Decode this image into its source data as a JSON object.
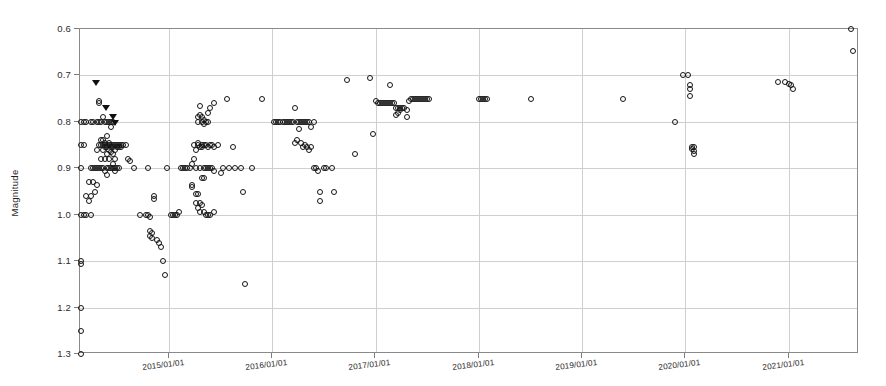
{
  "chart_data": {
    "type": "scatter",
    "title": "",
    "xlabel": "",
    "ylabel": "Magnitude",
    "grid": true,
    "legend": false,
    "y_inverted": true,
    "ylim": [
      0.6,
      1.3
    ],
    "yticks": [
      "0.6",
      "0.7",
      "0.8",
      "0.9",
      "1.0",
      "1.1",
      "1.2",
      "1.3"
    ],
    "ytick_values": [
      0.6,
      0.7,
      0.8,
      0.9,
      1.0,
      1.1,
      1.2,
      1.3
    ],
    "xticks": [
      "2015/01/01",
      "2016/01/01",
      "2017/01/01",
      "2018/01/01",
      "2019/01/01",
      "2020/01/01",
      "2021/01/01"
    ],
    "xtick_values": [
      2015.0,
      2016.0,
      2017.0,
      2018.0,
      2019.0,
      2020.0,
      2021.0
    ],
    "xlim": [
      2014.14,
      2021.68
    ],
    "marker_color": "#141414",
    "marker_style": "open-circle",
    "limit_marker_style": "filled-down-triangle",
    "series": [
      {
        "name": "observations",
        "marker": "open-circle",
        "points": [
          [
            2014.15,
            0.8
          ],
          [
            2014.15,
            0.85
          ],
          [
            2014.15,
            0.9
          ],
          [
            2014.15,
            1.0
          ],
          [
            2014.15,
            1.1
          ],
          [
            2014.15,
            1.105
          ],
          [
            2014.15,
            1.2
          ],
          [
            2014.15,
            1.25
          ],
          [
            2014.15,
            1.3
          ],
          [
            2014.18,
            0.8
          ],
          [
            2014.18,
            0.85
          ],
          [
            2014.18,
            1.0
          ],
          [
            2014.2,
            0.8
          ],
          [
            2014.2,
            0.96
          ],
          [
            2014.2,
            1.0
          ],
          [
            2014.23,
            0.93
          ],
          [
            2014.23,
            0.97
          ],
          [
            2014.25,
            0.8
          ],
          [
            2014.25,
            0.9
          ],
          [
            2014.25,
            0.96
          ],
          [
            2014.25,
            1.0
          ],
          [
            2014.27,
            0.8
          ],
          [
            2014.27,
            0.9
          ],
          [
            2014.27,
            0.93
          ],
          [
            2014.28,
            0.9
          ],
          [
            2014.28,
            0.95
          ],
          [
            2014.3,
            0.8
          ],
          [
            2014.3,
            0.86
          ],
          [
            2014.3,
            0.9
          ],
          [
            2014.3,
            0.935
          ],
          [
            2014.32,
            0.755
          ],
          [
            2014.32,
            0.76
          ],
          [
            2014.32,
            0.8
          ],
          [
            2014.32,
            0.85
          ],
          [
            2014.32,
            0.9
          ],
          [
            2014.34,
            0.8
          ],
          [
            2014.34,
            0.84
          ],
          [
            2014.34,
            0.85
          ],
          [
            2014.34,
            0.88
          ],
          [
            2014.34,
            0.9
          ],
          [
            2014.36,
            0.79
          ],
          [
            2014.36,
            0.84
          ],
          [
            2014.36,
            0.85
          ],
          [
            2014.36,
            0.86
          ],
          [
            2014.36,
            0.9
          ],
          [
            2014.38,
            0.8
          ],
          [
            2014.38,
            0.845
          ],
          [
            2014.38,
            0.85
          ],
          [
            2014.38,
            0.855
          ],
          [
            2014.38,
            0.88
          ],
          [
            2014.38,
            0.905
          ],
          [
            2014.4,
            0.8
          ],
          [
            2014.4,
            0.83
          ],
          [
            2014.4,
            0.85
          ],
          [
            2014.4,
            0.855
          ],
          [
            2014.4,
            0.87
          ],
          [
            2014.4,
            0.9
          ],
          [
            2014.4,
            0.915
          ],
          [
            2014.42,
            0.8
          ],
          [
            2014.42,
            0.845
          ],
          [
            2014.42,
            0.85
          ],
          [
            2014.42,
            0.86
          ],
          [
            2014.42,
            0.88
          ],
          [
            2014.42,
            0.9
          ],
          [
            2014.44,
            0.8
          ],
          [
            2014.44,
            0.81
          ],
          [
            2014.44,
            0.85
          ],
          [
            2014.44,
            0.855
          ],
          [
            2014.44,
            0.865
          ],
          [
            2014.44,
            0.9
          ],
          [
            2014.46,
            0.8
          ],
          [
            2014.46,
            0.85
          ],
          [
            2014.46,
            0.855
          ],
          [
            2014.46,
            0.87
          ],
          [
            2014.46,
            0.89
          ],
          [
            2014.46,
            0.9
          ],
          [
            2014.48,
            0.85
          ],
          [
            2014.48,
            0.86
          ],
          [
            2014.48,
            0.88
          ],
          [
            2014.48,
            0.9
          ],
          [
            2014.48,
            0.905
          ],
          [
            2014.5,
            0.85
          ],
          [
            2014.5,
            0.855
          ],
          [
            2014.5,
            0.9
          ],
          [
            2014.52,
            0.85
          ],
          [
            2014.52,
            0.855
          ],
          [
            2014.52,
            0.9
          ],
          [
            2014.54,
            0.85
          ],
          [
            2014.54,
            0.855
          ],
          [
            2014.56,
            0.85
          ],
          [
            2014.58,
            0.85
          ],
          [
            2014.6,
            0.88
          ],
          [
            2014.62,
            0.885
          ],
          [
            2014.66,
            0.9
          ],
          [
            2014.72,
            1.0
          ],
          [
            2014.78,
            1.0
          ],
          [
            2014.8,
            0.9
          ],
          [
            2014.8,
            1.0
          ],
          [
            2014.82,
            1.005
          ],
          [
            2014.82,
            1.035
          ],
          [
            2014.82,
            1.045
          ],
          [
            2014.84,
            1.04
          ],
          [
            2014.84,
            1.05
          ],
          [
            2014.86,
            0.96
          ],
          [
            2014.86,
            0.965
          ],
          [
            2014.88,
            1.055
          ],
          [
            2014.9,
            1.06
          ],
          [
            2014.92,
            1.07
          ],
          [
            2014.94,
            1.1
          ],
          [
            2014.96,
            1.13
          ],
          [
            2014.98,
            0.9
          ],
          [
            2015.02,
            1.0
          ],
          [
            2015.04,
            1.0
          ],
          [
            2015.06,
            1.0
          ],
          [
            2015.08,
            1.0
          ],
          [
            2015.1,
            0.995
          ],
          [
            2015.12,
            0.9
          ],
          [
            2015.14,
            0.9
          ],
          [
            2015.16,
            0.9
          ],
          [
            2015.18,
            0.9
          ],
          [
            2015.2,
            0.9
          ],
          [
            2015.22,
            0.89
          ],
          [
            2015.22,
            0.935
          ],
          [
            2015.22,
            0.94
          ],
          [
            2015.24,
            0.85
          ],
          [
            2015.24,
            0.88
          ],
          [
            2015.26,
            0.86
          ],
          [
            2015.26,
            0.9
          ],
          [
            2015.26,
            0.955
          ],
          [
            2015.26,
            0.975
          ],
          [
            2015.28,
            0.79
          ],
          [
            2015.28,
            0.8
          ],
          [
            2015.28,
            0.845
          ],
          [
            2015.28,
            0.85
          ],
          [
            2015.28,
            0.955
          ],
          [
            2015.28,
            0.985
          ],
          [
            2015.3,
            0.765
          ],
          [
            2015.3,
            0.785
          ],
          [
            2015.3,
            0.855
          ],
          [
            2015.3,
            0.9
          ],
          [
            2015.3,
            0.975
          ],
          [
            2015.3,
            0.995
          ],
          [
            2015.32,
            0.79
          ],
          [
            2015.32,
            0.8
          ],
          [
            2015.32,
            0.85
          ],
          [
            2015.32,
            0.855
          ],
          [
            2015.32,
            0.92
          ],
          [
            2015.32,
            0.98
          ],
          [
            2015.34,
            0.795
          ],
          [
            2015.34,
            0.805
          ],
          [
            2015.34,
            0.85
          ],
          [
            2015.34,
            0.9
          ],
          [
            2015.34,
            0.92
          ],
          [
            2015.34,
            0.995
          ],
          [
            2015.36,
            0.8
          ],
          [
            2015.36,
            0.85
          ],
          [
            2015.36,
            0.9
          ],
          [
            2015.36,
            1.0
          ],
          [
            2015.38,
            0.78
          ],
          [
            2015.38,
            0.8
          ],
          [
            2015.38,
            0.855
          ],
          [
            2015.38,
            0.9
          ],
          [
            2015.38,
            1.0
          ],
          [
            2015.4,
            0.77
          ],
          [
            2015.4,
            0.85
          ],
          [
            2015.4,
            0.9
          ],
          [
            2015.4,
            1.0
          ],
          [
            2015.42,
            0.85
          ],
          [
            2015.42,
            0.9
          ],
          [
            2015.44,
            0.76
          ],
          [
            2015.44,
            0.855
          ],
          [
            2015.44,
            0.905
          ],
          [
            2015.44,
            0.995
          ],
          [
            2015.48,
            0.85
          ],
          [
            2015.5,
            0.91
          ],
          [
            2015.52,
            0.9
          ],
          [
            2015.56,
            0.75
          ],
          [
            2015.58,
            0.9
          ],
          [
            2015.62,
            0.855
          ],
          [
            2015.64,
            0.9
          ],
          [
            2015.7,
            0.9
          ],
          [
            2015.72,
            0.95
          ],
          [
            2015.74,
            1.15
          ],
          [
            2015.8,
            0.9
          ],
          [
            2015.9,
            0.75
          ],
          [
            2016.02,
            0.8
          ],
          [
            2016.04,
            0.8
          ],
          [
            2016.06,
            0.8
          ],
          [
            2016.08,
            0.8
          ],
          [
            2016.1,
            0.8
          ],
          [
            2016.12,
            0.8
          ],
          [
            2016.14,
            0.8
          ],
          [
            2016.16,
            0.8
          ],
          [
            2016.18,
            0.8
          ],
          [
            2016.2,
            0.8
          ],
          [
            2016.22,
            0.77
          ],
          [
            2016.22,
            0.845
          ],
          [
            2016.24,
            0.8
          ],
          [
            2016.24,
            0.84
          ],
          [
            2016.26,
            0.8
          ],
          [
            2016.26,
            0.815
          ],
          [
            2016.28,
            0.8
          ],
          [
            2016.28,
            0.845
          ],
          [
            2016.3,
            0.8
          ],
          [
            2016.3,
            0.855
          ],
          [
            2016.32,
            0.8
          ],
          [
            2016.32,
            0.85
          ],
          [
            2016.34,
            0.8
          ],
          [
            2016.34,
            0.855
          ],
          [
            2016.36,
            0.8
          ],
          [
            2016.36,
            0.86
          ],
          [
            2016.38,
            0.81
          ],
          [
            2016.38,
            0.855
          ],
          [
            2016.4,
            0.8
          ],
          [
            2016.4,
            0.9
          ],
          [
            2016.42,
            0.9
          ],
          [
            2016.44,
            0.905
          ],
          [
            2016.46,
            0.95
          ],
          [
            2016.46,
            0.97
          ],
          [
            2016.5,
            0.9
          ],
          [
            2016.52,
            0.9
          ],
          [
            2016.58,
            0.9
          ],
          [
            2016.6,
            0.95
          ],
          [
            2016.72,
            0.71
          ],
          [
            2016.8,
            0.87
          ],
          [
            2017.0,
            0.755
          ],
          [
            2017.02,
            0.76
          ],
          [
            2017.04,
            0.76
          ],
          [
            2017.06,
            0.76
          ],
          [
            2017.08,
            0.76
          ],
          [
            2017.1,
            0.76
          ],
          [
            2017.12,
            0.76
          ],
          [
            2017.14,
            0.76
          ],
          [
            2017.16,
            0.76
          ],
          [
            2017.18,
            0.76
          ],
          [
            2017.2,
            0.77
          ],
          [
            2017.2,
            0.785
          ],
          [
            2017.22,
            0.77
          ],
          [
            2017.22,
            0.78
          ],
          [
            2017.24,
            0.77
          ],
          [
            2017.24,
            0.775
          ],
          [
            2017.26,
            0.77
          ],
          [
            2017.28,
            0.77
          ],
          [
            2017.3,
            0.775
          ],
          [
            2017.32,
            0.755
          ],
          [
            2017.34,
            0.75
          ],
          [
            2017.36,
            0.75
          ],
          [
            2017.38,
            0.75
          ],
          [
            2017.4,
            0.75
          ],
          [
            2017.42,
            0.75
          ],
          [
            2017.44,
            0.75
          ],
          [
            2017.46,
            0.75
          ],
          [
            2017.48,
            0.75
          ],
          [
            2017.5,
            0.75
          ],
          [
            2017.52,
            0.75
          ],
          [
            2017.14,
            0.72
          ],
          [
            2017.3,
            0.79
          ],
          [
            2016.95,
            0.705
          ],
          [
            2016.98,
            0.825
          ],
          [
            2018.0,
            0.75
          ],
          [
            2018.02,
            0.75
          ],
          [
            2018.04,
            0.75
          ],
          [
            2018.06,
            0.75
          ],
          [
            2018.08,
            0.75
          ],
          [
            2018.5,
            0.75
          ],
          [
            2019.4,
            0.75
          ],
          [
            2019.9,
            0.8
          ],
          [
            2019.98,
            0.7
          ],
          [
            2020.02,
            0.698
          ],
          [
            2020.04,
            0.72
          ],
          [
            2020.04,
            0.73
          ],
          [
            2020.04,
            0.745
          ],
          [
            2020.06,
            0.855
          ],
          [
            2020.06,
            0.858
          ],
          [
            2020.08,
            0.855
          ],
          [
            2020.08,
            0.862
          ],
          [
            2020.08,
            0.87
          ],
          [
            2020.9,
            0.715
          ],
          [
            2020.96,
            0.715
          ],
          [
            2021.0,
            0.718
          ],
          [
            2021.02,
            0.72
          ],
          [
            2021.04,
            0.73
          ],
          [
            2021.6,
            0.6
          ],
          [
            2021.62,
            0.648
          ]
        ]
      },
      {
        "name": "upper-limits",
        "marker": "filled-down-triangle",
        "points": [
          [
            2014.29,
            0.716
          ],
          [
            2014.39,
            0.771
          ],
          [
            2014.46,
            0.79
          ],
          [
            2014.48,
            0.802
          ]
        ]
      }
    ]
  },
  "axes": {
    "y_axis_title": "Magnitude"
  }
}
